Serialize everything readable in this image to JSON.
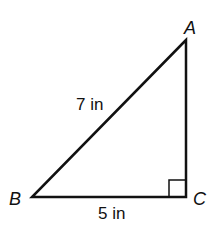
{
  "diagram": {
    "type": "right-triangle",
    "vertices": {
      "A": {
        "label": "A"
      },
      "B": {
        "label": "B"
      },
      "C": {
        "label": "C"
      }
    },
    "sides": {
      "AB": {
        "label": "7 in"
      },
      "BC": {
        "label": "5 in"
      }
    },
    "right_angle_at": "C",
    "colors": {
      "stroke": "#111111",
      "background": "#ffffff"
    }
  }
}
